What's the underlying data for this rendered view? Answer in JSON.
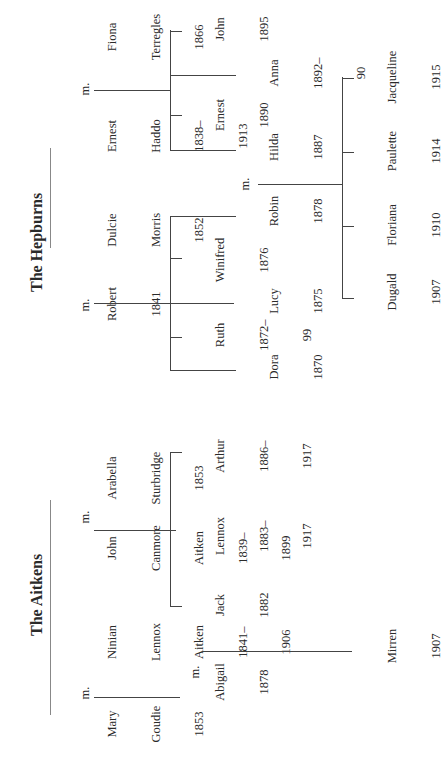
{
  "families": [
    {
      "title": "The Hepburns",
      "couples": [
        {
          "a": {
            "name": [
              "Robert"
            ],
            "dates": [
              "1841"
            ]
          },
          "marker": "m.",
          "b": {
            "name": [
              "Dulcie",
              "Morris"
            ],
            "dates": [
              "1852"
            ]
          }
        },
        {
          "a": {
            "name": [
              "Ernest",
              "Haddo"
            ],
            "dates": [
              "1838–",
              "1913"
            ]
          },
          "marker": "m.",
          "b": {
            "name": [
              "Fiona",
              "Terregles"
            ],
            "dates": [
              "1866"
            ]
          }
        }
      ],
      "children_robert_dulcie": [
        {
          "name": "Dora",
          "dates": [
            "1870"
          ]
        },
        {
          "name": "Ruth",
          "dates": [
            "1872–",
            "99"
          ]
        },
        {
          "name": "Lucy",
          "dates": [
            "1875"
          ]
        },
        {
          "name": "Winifred",
          "dates": [
            "1876"
          ]
        },
        {
          "name": "Robin",
          "dates": [
            "1878"
          ]
        }
      ],
      "children_ernest_fiona": [
        {
          "name": "Hilda",
          "dates": [
            "1887"
          ]
        },
        {
          "name": "Ernest",
          "dates": [
            "1890"
          ]
        },
        {
          "name": "Anna",
          "dates": [
            "1892–",
            "90"
          ]
        },
        {
          "name": "John",
          "dates": [
            "1895"
          ]
        }
      ],
      "second_marriage": {
        "a": "Robin",
        "marker": "m.",
        "b": "Hilda"
      },
      "grandchildren": [
        {
          "name": "Dugald",
          "dates": [
            "1907"
          ]
        },
        {
          "name": "Floriana",
          "dates": [
            "1910"
          ]
        },
        {
          "name": "Paulette",
          "dates": [
            "1914"
          ]
        },
        {
          "name": "Jacqueline",
          "dates": [
            "1915"
          ]
        }
      ]
    },
    {
      "title": "The Aitkens",
      "couples": [
        {
          "a": {
            "name": [
              "Mary",
              "Goudie"
            ],
            "dates": [
              "1853"
            ]
          },
          "marker": "m.",
          "b": {
            "name": [
              "Ninian",
              "Lennox",
              "Aitken"
            ],
            "dates": [
              "1841–",
              "1906"
            ]
          }
        },
        {
          "a": {
            "name": [
              "John",
              "Canmore",
              "Aitken"
            ],
            "dates": [
              "1839–",
              "1899"
            ]
          },
          "marker": "m.",
          "b": {
            "name": [
              "Arabella",
              "Sturbridge"
            ],
            "dates": [
              "1853"
            ]
          }
        }
      ],
      "children_mary_ninian": [
        {
          "name": "Abigail",
          "dates": [
            "1878"
          ]
        }
      ],
      "children_john_arabella": [
        {
          "name": "Jack",
          "dates": [
            "1882"
          ]
        },
        {
          "name": "Lennox",
          "dates": [
            "1883–",
            "1917"
          ]
        },
        {
          "name": "Arthur",
          "dates": [
            "1886–",
            "1917"
          ]
        }
      ],
      "second_marriage": {
        "a": "Abigail",
        "marker": "m.",
        "b": "Jack"
      },
      "grandchildren": [
        {
          "name": "Mirren",
          "dates": [
            "1907"
          ]
        }
      ]
    }
  ]
}
